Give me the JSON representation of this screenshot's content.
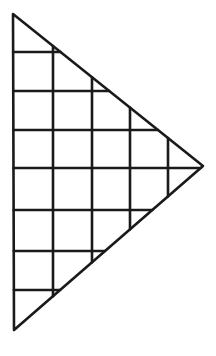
{
  "diagram": {
    "type": "gridded-triangle",
    "stroke_color": "#1a1a1a",
    "background": "#ffffff",
    "stroke_width": 2.6,
    "triangle": {
      "vertices": [
        [
          13,
          14
        ],
        [
          203,
          166
        ],
        [
          14,
          330
        ]
      ]
    },
    "vertical_lines_x": [
      53,
      92,
      130,
      168
    ],
    "horizontal_lines_y": [
      52,
      91,
      130,
      168,
      210,
      251,
      290
    ]
  }
}
